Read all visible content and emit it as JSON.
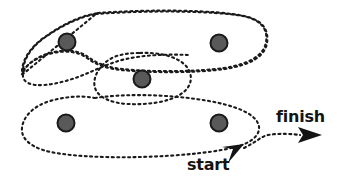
{
  "figure": {
    "type": "diagram",
    "width": 337,
    "height": 188,
    "background_color": "#ffffff"
  },
  "labels": {
    "start": "start",
    "finish": "finish"
  },
  "style": {
    "stroke_color": "#1a1a1a",
    "dash_pattern": "2 3",
    "stroke_width": 2.1,
    "node_fill": "#595959",
    "node_stroke": "#1a1a1a",
    "node_radius": 8.5,
    "text_color": "#141414"
  },
  "clusters": [
    {
      "name": "top-cluster",
      "node_count": 2,
      "nodes": [
        {
          "name": "node-top-left",
          "cx": 67,
          "cy": 42
        },
        {
          "name": "node-top-right",
          "cx": 219,
          "cy": 43
        }
      ]
    },
    {
      "name": "middle-cluster",
      "node_count": 1,
      "nodes": [
        {
          "name": "node-middle",
          "cx": 142,
          "cy": 79
        }
      ]
    },
    {
      "name": "bottom-cluster",
      "node_count": 2,
      "nodes": [
        {
          "name": "node-bottom-left",
          "cx": 66,
          "cy": 123
        },
        {
          "name": "node-bottom-right",
          "cx": 219,
          "cy": 123
        }
      ]
    }
  ],
  "path": {
    "name": "traversal-path",
    "start_marker": {
      "x": 245,
      "y": 150,
      "direction": "down-left"
    },
    "finish_marker": {
      "x": 320,
      "y": 135,
      "direction": "right"
    }
  }
}
